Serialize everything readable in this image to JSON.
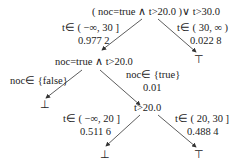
{
  "diagram": {
    "type": "decision-tree",
    "colors": {
      "line": "#333333",
      "text": "#222222",
      "background": "#ffffff"
    },
    "nodes": {
      "root": "( noc=true ∧ t>20.0 )∨ t>30.0",
      "n2": "noc=true ∧ t>20.0",
      "n3": "t>20.0",
      "leaf_top_right": "⊤",
      "leaf_n2_left": "⊥",
      "leaf_n3_left": "⊥",
      "leaf_n3_right": "⊤"
    },
    "edges": {
      "root_left": {
        "condition": "t∈ ( −∞, 30 ]",
        "prob": "0.977 2"
      },
      "root_right": {
        "condition": "t∈ ( 30, ∞ )",
        "prob": "0.022 8"
      },
      "n2_left": {
        "condition": "noc∈ {false}"
      },
      "n2_right": {
        "condition": "noc∈ {true}",
        "prob": "0.01"
      },
      "n3_left": {
        "condition": "t∈ ( −∞, 20 ]",
        "prob": "0.511 6"
      },
      "n3_right": {
        "condition": "t∈ ( 20, 30 ]",
        "prob": "0.488 4"
      }
    }
  }
}
